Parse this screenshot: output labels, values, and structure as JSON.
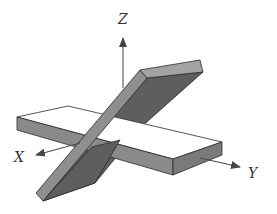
{
  "figure": {
    "axes": {
      "x": {
        "label": "X"
      },
      "y": {
        "label": "Y"
      },
      "z": {
        "label": "Z"
      }
    },
    "colors": {
      "background": "#ffffff",
      "outline": "#2b2b2b",
      "plate_top": "#ffffff",
      "plate_side_light": "#8f8f8f",
      "plate_side_mid": "#7a7a7a",
      "plate_side_dark": "#5e5e5e",
      "plate_end_top": "#a3a3a3",
      "axis": "#444444"
    }
  }
}
